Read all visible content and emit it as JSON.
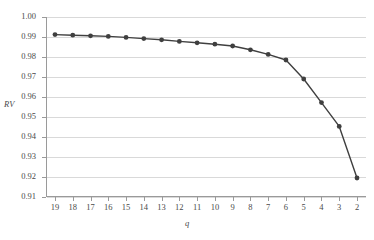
{
  "chart_data": {
    "type": "line",
    "title": "",
    "subtitle": "",
    "xlabel": "q",
    "ylabel": "RV",
    "x": [
      19,
      18,
      17,
      16,
      15,
      14,
      13,
      12,
      11,
      10,
      9,
      8,
      7,
      6,
      5,
      4,
      3,
      2
    ],
    "categories": [
      "19",
      "18",
      "17",
      "16",
      "15",
      "14",
      "13",
      "12",
      "11",
      "10",
      "9",
      "8",
      "7",
      "6",
      "5",
      "4",
      "3",
      "2"
    ],
    "values": [
      0.9912,
      0.9909,
      0.9906,
      0.9903,
      0.9898,
      0.9892,
      0.9886,
      0.9878,
      0.9871,
      0.9864,
      0.9855,
      0.9836,
      0.9813,
      0.9785,
      0.969,
      0.9572,
      0.9453,
      0.9195
    ],
    "series": [
      {
        "name": "RV",
        "values": [
          0.9912,
          0.9909,
          0.9906,
          0.9903,
          0.9898,
          0.9892,
          0.9886,
          0.9878,
          0.9871,
          0.9864,
          0.9855,
          0.9836,
          0.9813,
          0.9785,
          0.969,
          0.9572,
          0.9453,
          0.9195
        ],
        "color": "#3f3f3f",
        "marker": "circle"
      }
    ],
    "ylim": [
      0.91,
      1.0
    ],
    "ytick_step": 0.01,
    "ytick_labels": [
      "1.00",
      "0.99",
      "0.98",
      "0.97",
      "0.96",
      "0.95",
      "0.94",
      "0.93",
      "0.92",
      "0.91"
    ],
    "ytick_values": [
      1.0,
      0.99,
      0.98,
      0.97,
      0.96,
      0.95,
      0.94,
      0.93,
      0.92,
      0.91
    ],
    "x_axis_direction": "descending",
    "grid": {
      "horizontal": true,
      "vertical": false,
      "color": "#d9d9d9"
    },
    "legend": {
      "visible": false,
      "position": "none"
    },
    "axis_color": "#9a9a9a",
    "background_color": "#ffffff"
  }
}
